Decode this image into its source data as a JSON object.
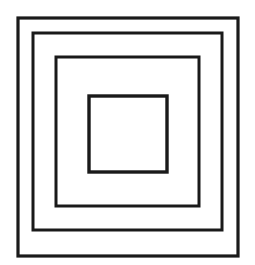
{
  "figure": {
    "canvas": {
      "width": 255,
      "height": 265,
      "background_color": "#ffffff"
    },
    "stroke_color": "#1a1a1a",
    "fill_color": "none",
    "shape_count": "4",
    "shape_kind": "square",
    "squares": [
      {
        "name": "outer-square",
        "order": "1",
        "x": 18,
        "y": 18,
        "width": 220,
        "height": 238,
        "stroke_width": 3.2
      },
      {
        "name": "second-square",
        "order": "2",
        "x": 33,
        "y": 33,
        "width": 189,
        "height": 197,
        "stroke_width": 3.0
      },
      {
        "name": "third-square",
        "order": "3",
        "x": 56,
        "y": 57,
        "width": 143,
        "height": 149,
        "stroke_width": 3.0
      },
      {
        "name": "inner-square",
        "order": "4",
        "x": 89,
        "y": 96,
        "width": 78,
        "height": 76,
        "stroke_width": 3.4
      }
    ]
  }
}
